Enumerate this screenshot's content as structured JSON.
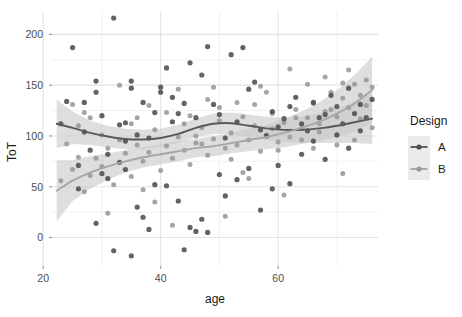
{
  "chart_data": {
    "type": "scatter",
    "title": "",
    "xlabel": "age",
    "ylabel": "ToT",
    "xlim": [
      21.5,
      77
    ],
    "ylim": [
      -28,
      222
    ],
    "xticks": [
      20,
      40,
      60
    ],
    "yticks": [
      0,
      50,
      100,
      150,
      200
    ],
    "grid": true,
    "legend": {
      "title": "Design",
      "position": "right",
      "entries": [
        {
          "name": "A",
          "color": "#595959",
          "point_color": "#4d4d4d"
        },
        {
          "name": "B",
          "color": "#a6a6a6",
          "point_color": "#999999"
        }
      ]
    },
    "panel_background": "#ffffff",
    "grid_color": "#ebebeb",
    "ribbon_color": "#c9c9c9",
    "series": [
      {
        "name": "A",
        "color": "#595959",
        "smooth_x": [
          22.3,
          25,
          28,
          31,
          34,
          37,
          40,
          43,
          46,
          49,
          52,
          55,
          58,
          61,
          64,
          67,
          70,
          73,
          76
        ],
        "smooth_y": [
          112,
          108,
          103,
          99.5,
          97,
          96.5,
          98,
          102,
          108,
          112,
          112.5,
          110,
          107.5,
          106,
          106,
          107.5,
          110,
          113.5,
          117
        ],
        "ci_upper": [
          136,
          124,
          115,
          110,
          107,
          106,
          107,
          111,
          117,
          122,
          123,
          121,
          119,
          118,
          119,
          122,
          127,
          134,
          142
        ],
        "ci_lower": [
          88,
          92,
          91,
          89,
          87,
          87,
          89,
          93,
          99,
          102,
          102,
          99,
          96,
          94,
          93,
          93,
          93,
          93,
          92
        ],
        "points": [
          [
            23,
            112
          ],
          [
            24,
            134
          ],
          [
            25,
            187
          ],
          [
            27,
            133
          ],
          [
            29,
            154
          ],
          [
            29,
            143
          ],
          [
            30,
            120
          ],
          [
            31,
            82
          ],
          [
            32,
            216
          ],
          [
            33,
            111
          ],
          [
            34,
            113
          ],
          [
            34,
            95
          ],
          [
            35,
            154
          ],
          [
            35,
            147
          ],
          [
            36,
            101
          ],
          [
            37,
            133
          ],
          [
            38,
            98
          ],
          [
            39,
            123
          ],
          [
            40,
            148
          ],
          [
            40,
            143
          ],
          [
            41,
            167
          ],
          [
            42,
            114
          ],
          [
            42,
            138
          ],
          [
            43,
            122
          ],
          [
            44,
            132
          ],
          [
            45,
            172
          ],
          [
            46,
            118
          ],
          [
            47,
            160
          ],
          [
            48,
            188
          ],
          [
            49,
            131
          ],
          [
            50,
            121
          ],
          [
            51,
            98
          ],
          [
            52,
            180
          ],
          [
            53,
            114
          ],
          [
            54,
            187
          ],
          [
            55,
            146
          ],
          [
            56,
            153
          ],
          [
            57,
            106
          ],
          [
            58,
            100
          ],
          [
            59,
            124
          ],
          [
            60,
            109
          ],
          [
            61,
            117
          ],
          [
            62,
            129
          ],
          [
            63,
            138
          ],
          [
            64,
            112
          ],
          [
            65,
            105
          ],
          [
            66,
            133
          ],
          [
            67,
            118
          ],
          [
            68,
            121
          ],
          [
            69,
            140
          ],
          [
            70,
            129
          ],
          [
            71,
            112
          ],
          [
            72,
            147
          ],
          [
            73,
            122
          ],
          [
            74,
            131
          ],
          [
            75,
            118
          ],
          [
            26,
            71
          ],
          [
            28,
            86
          ],
          [
            30,
            63
          ],
          [
            31,
            58
          ],
          [
            33,
            74
          ],
          [
            34,
            67
          ],
          [
            36,
            30
          ],
          [
            37,
            20
          ],
          [
            39,
            52
          ],
          [
            41,
            51
          ],
          [
            43,
            36
          ],
          [
            45,
            10
          ],
          [
            47,
            18
          ],
          [
            48,
            5
          ],
          [
            50,
            62
          ],
          [
            51,
            41
          ],
          [
            53,
            57
          ],
          [
            55,
            68
          ],
          [
            57,
            27
          ],
          [
            59,
            48
          ],
          [
            60,
            71
          ],
          [
            62,
            53
          ],
          [
            64,
            82
          ],
          [
            66,
            95
          ],
          [
            68,
            77
          ],
          [
            70,
            101
          ],
          [
            72,
            88
          ],
          [
            74,
            105
          ],
          [
            29,
            14
          ],
          [
            32,
            -13
          ],
          [
            35,
            -18
          ],
          [
            38,
            8
          ],
          [
            44,
            -12
          ],
          [
            46,
            6
          ],
          [
            26,
            48
          ],
          [
            27,
            104
          ],
          [
            76,
            136
          ]
        ]
      },
      {
        "name": "B",
        "color": "#a6a6a6",
        "smooth_x": [
          22.3,
          25,
          28,
          31,
          34,
          37,
          40,
          43,
          46,
          49,
          52,
          55,
          58,
          61,
          64,
          67,
          70,
          73,
          76
        ],
        "smooth_y": [
          46,
          56,
          64,
          70,
          75,
          79,
          82,
          85,
          88,
          90,
          93,
          96,
          99,
          103,
          108,
          114,
          122,
          132,
          145
        ],
        "ci_upper": [
          76,
          76,
          80,
          83,
          86,
          89,
          92,
          95,
          97,
          100,
          103,
          107,
          111,
          117,
          124,
          133,
          145,
          160,
          178
        ],
        "ci_lower": [
          16,
          36,
          48,
          57,
          64,
          69,
          72,
          75,
          79,
          80,
          83,
          85,
          87,
          89,
          92,
          95,
          99,
          104,
          112
        ]
      }
    ],
    "points_light": [
      [
        23,
        56
      ],
      [
        25,
        67
      ],
      [
        26,
        79
      ],
      [
        27,
        45
      ],
      [
        28,
        61
      ],
      [
        29,
        78
      ],
      [
        30,
        70
      ],
      [
        31,
        88
      ],
      [
        32,
        52
      ],
      [
        33,
        96
      ],
      [
        34,
        83
      ],
      [
        35,
        60
      ],
      [
        36,
        91
      ],
      [
        37,
        75
      ],
      [
        38,
        84
      ],
      [
        39,
        106
      ],
      [
        40,
        66
      ],
      [
        41,
        90
      ],
      [
        42,
        78
      ],
      [
        43,
        99
      ],
      [
        44,
        86
      ],
      [
        45,
        72
      ],
      [
        46,
        93
      ],
      [
        47,
        108
      ],
      [
        48,
        81
      ],
      [
        49,
        97
      ],
      [
        50,
        115
      ],
      [
        51,
        88
      ],
      [
        52,
        103
      ],
      [
        53,
        91
      ],
      [
        54,
        119
      ],
      [
        55,
        96
      ],
      [
        56,
        110
      ],
      [
        57,
        85
      ],
      [
        58,
        101
      ],
      [
        59,
        122
      ],
      [
        60,
        94
      ],
      [
        61,
        113
      ],
      [
        62,
        99
      ],
      [
        63,
        126
      ],
      [
        64,
        107
      ],
      [
        65,
        118
      ],
      [
        66,
        132
      ],
      [
        67,
        112
      ],
      [
        68,
        124
      ],
      [
        69,
        143
      ],
      [
        70,
        119
      ],
      [
        71,
        137
      ],
      [
        72,
        128
      ],
      [
        73,
        151
      ],
      [
        74,
        140
      ],
      [
        75,
        155
      ],
      [
        76,
        148
      ],
      [
        24,
        92
      ],
      [
        26,
        110
      ],
      [
        28,
        118
      ],
      [
        30,
        101
      ],
      [
        36,
        118
      ],
      [
        38,
        130
      ],
      [
        44,
        112
      ],
      [
        46,
        100
      ],
      [
        48,
        136
      ],
      [
        50,
        128
      ],
      [
        52,
        77
      ],
      [
        54,
        64
      ],
      [
        56,
        131
      ],
      [
        58,
        143
      ],
      [
        60,
        86
      ],
      [
        62,
        166
      ],
      [
        64,
        96
      ],
      [
        66,
        88
      ],
      [
        68,
        158
      ],
      [
        70,
        91
      ],
      [
        72,
        165
      ],
      [
        74,
        117
      ],
      [
        76,
        108
      ],
      [
        25,
        131
      ],
      [
        27,
        123
      ],
      [
        33,
        150
      ],
      [
        35,
        112
      ],
      [
        41,
        123
      ],
      [
        43,
        146
      ],
      [
        45,
        120
      ],
      [
        47,
        92
      ],
      [
        49,
        148
      ],
      [
        53,
        133
      ],
      [
        57,
        149
      ],
      [
        59,
        107
      ],
      [
        63,
        118
      ],
      [
        65,
        151
      ],
      [
        67,
        104
      ],
      [
        69,
        126
      ],
      [
        71,
        152
      ],
      [
        73,
        96
      ],
      [
        31,
        24
      ],
      [
        37,
        47
      ],
      [
        39,
        35
      ],
      [
        42,
        12
      ],
      [
        51,
        21
      ],
      [
        55,
        58
      ],
      [
        61,
        42
      ],
      [
        71,
        63
      ],
      [
        75,
        130
      ]
    ]
  }
}
